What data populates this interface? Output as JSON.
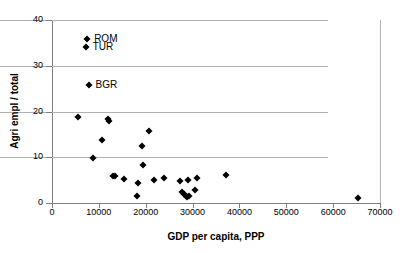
{
  "chart_data": {
    "type": "scatter",
    "title": "",
    "xlabel": "GDP per capita, PPP",
    "ylabel": "Agri empl / total",
    "xlim": [
      0,
      70000
    ],
    "ylim": [
      0,
      40
    ],
    "xticks": [
      0,
      10000,
      20000,
      30000,
      40000,
      50000,
      60000,
      70000
    ],
    "xtick_labels": [
      "0",
      "10000",
      "20000",
      "30000",
      "40000",
      "50000",
      "60000",
      "70000"
    ],
    "yticks": [
      0,
      10,
      20,
      30,
      40
    ],
    "ytick_labels": [
      "0",
      "10",
      "20",
      "30",
      "40"
    ],
    "grid": "horizontal",
    "legend": "none",
    "marker": "filled-diamond",
    "marker_color": "#000000",
    "points": [
      {
        "x": 7500,
        "y": 35.8,
        "label": "ROM"
      },
      {
        "x": 7200,
        "y": 34.0,
        "label": "TUR"
      },
      {
        "x": 7800,
        "y": 25.8,
        "label": "BGR"
      },
      {
        "x": 5500,
        "y": 18.9,
        "label": ""
      },
      {
        "x": 12000,
        "y": 18.3,
        "label": ""
      },
      {
        "x": 12100,
        "y": 17.9,
        "label": ""
      },
      {
        "x": 20700,
        "y": 15.8,
        "label": ""
      },
      {
        "x": 10600,
        "y": 13.7,
        "label": ""
      },
      {
        "x": 19200,
        "y": 12.5,
        "label": ""
      },
      {
        "x": 8700,
        "y": 9.9,
        "label": ""
      },
      {
        "x": 19400,
        "y": 8.4,
        "label": ""
      },
      {
        "x": 37100,
        "y": 6.2,
        "label": ""
      },
      {
        "x": 13100,
        "y": 6.0,
        "label": ""
      },
      {
        "x": 13400,
        "y": 5.8,
        "label": ""
      },
      {
        "x": 24000,
        "y": 5.5,
        "label": ""
      },
      {
        "x": 30900,
        "y": 5.4,
        "label": ""
      },
      {
        "x": 15300,
        "y": 5.3,
        "label": ""
      },
      {
        "x": 21700,
        "y": 5.1,
        "label": ""
      },
      {
        "x": 29100,
        "y": 5.0,
        "label": ""
      },
      {
        "x": 27300,
        "y": 4.7,
        "label": ""
      },
      {
        "x": 18300,
        "y": 4.3,
        "label": ""
      },
      {
        "x": 30600,
        "y": 2.8,
        "label": ""
      },
      {
        "x": 27800,
        "y": 2.3,
        "label": ""
      },
      {
        "x": 28100,
        "y": 1.9,
        "label": ""
      },
      {
        "x": 28500,
        "y": 1.5,
        "label": ""
      },
      {
        "x": 28900,
        "y": 1.4,
        "label": ""
      },
      {
        "x": 29300,
        "y": 1.6,
        "label": ""
      },
      {
        "x": 18200,
        "y": 1.6,
        "label": ""
      },
      {
        "x": 65400,
        "y": 1.1,
        "label": ""
      }
    ]
  },
  "colors": {
    "marker": "#000000",
    "grid": "#b3b3b3",
    "axis": "#7f7f7f",
    "background": "#ffffff",
    "text": "#000000"
  }
}
